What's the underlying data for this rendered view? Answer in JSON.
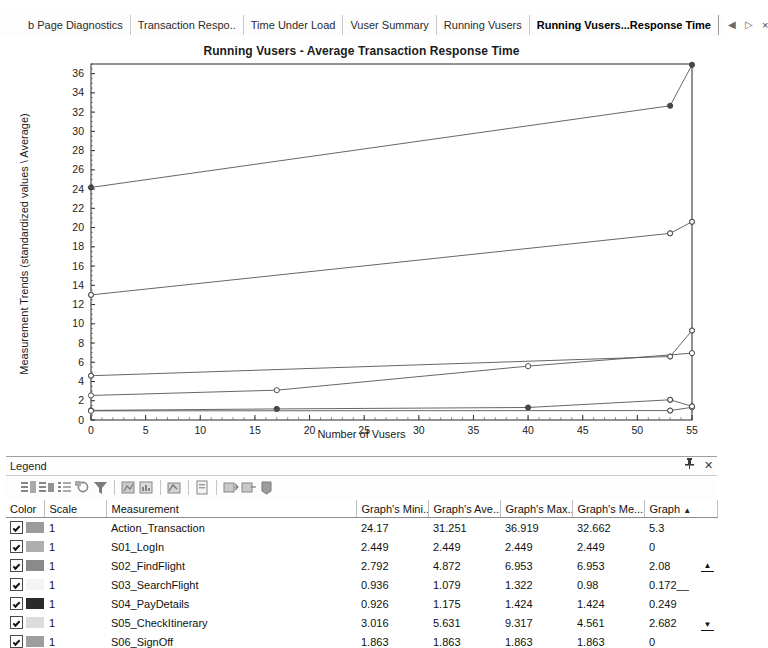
{
  "tabs": [
    {
      "label": "b Page Diagnostics",
      "active": false
    },
    {
      "label": "Transaction Respo..",
      "active": false
    },
    {
      "label": "Time Under Load",
      "active": false
    },
    {
      "label": "Vuser Summary",
      "active": false
    },
    {
      "label": "Running Vusers",
      "active": false
    },
    {
      "label": "Running Vusers...Response Time",
      "active": true
    }
  ],
  "tab_nav": {
    "prev": "◀",
    "next": "▷",
    "close": "×"
  },
  "chart_data": {
    "type": "line",
    "title": "Running Vusers - Average Transaction Response Time",
    "xlabel": "Number of Vusers",
    "ylabel": "Measurement Trends (standardized values \\ Average)",
    "xlim": [
      0,
      55
    ],
    "ylim": [
      0,
      37
    ],
    "xticks": [
      0,
      5,
      10,
      15,
      20,
      25,
      30,
      35,
      40,
      45,
      50,
      55
    ],
    "yticks": [
      0,
      2,
      4,
      6,
      8,
      10,
      12,
      14,
      16,
      18,
      20,
      22,
      24,
      26,
      28,
      30,
      32,
      34,
      36
    ],
    "grid": false,
    "legend_position": "bottom-panel",
    "series": [
      {
        "name": "Action_Transaction",
        "color": "#808080",
        "points": [
          [
            0,
            24.17
          ],
          [
            53,
            32.662
          ],
          [
            55,
            36.919
          ]
        ]
      },
      {
        "name": "S05_CheckItinerary",
        "color": "#c0c0c0",
        "points": [
          [
            0,
            13.0
          ],
          [
            53,
            19.4
          ],
          [
            55,
            20.6
          ]
        ]
      },
      {
        "name": "S02_FindFlight",
        "color": "#909090",
        "points": [
          [
            0,
            4.6
          ],
          [
            53,
            6.6
          ],
          [
            55,
            9.3
          ]
        ]
      },
      {
        "name": "S01_LogIn",
        "color": "#a8a8a8",
        "points": [
          [
            0,
            2.55
          ],
          [
            17,
            3.1
          ],
          [
            40,
            5.6
          ],
          [
            55,
            6.95
          ]
        ]
      },
      {
        "name": "S04_PayDetails",
        "color": "#303030",
        "points": [
          [
            0,
            1.0
          ],
          [
            17,
            1.15
          ],
          [
            40,
            1.3
          ],
          [
            53,
            2.1
          ],
          [
            55,
            1.42
          ]
        ]
      },
      {
        "name": "S03_SearchFlight",
        "color": "#e4e4e4",
        "points": [
          [
            0,
            0.95
          ],
          [
            53,
            0.98
          ],
          [
            55,
            1.32
          ]
        ]
      }
    ]
  },
  "legend": {
    "title": "Legend",
    "pin_icon": "pin-icon",
    "close_icon": "close-icon",
    "toolbar_icons": [
      "show-all-icon",
      "hide-all-icon",
      "list-icon",
      "configure-icon",
      "filter-icon",
      "merge-icon",
      "break-down-icon",
      "auto-correlate-icon",
      "properties-icon",
      "drill-down-icon",
      "export-icon",
      "delete-icon"
    ],
    "columns": [
      "Color",
      "Scale",
      "Measurement",
      "Graph's Mini...",
      "Graph's Ave...",
      "Graph's Max...",
      "Graph's Me...",
      "Graph"
    ],
    "sort_indicator": "▲",
    "rows": [
      {
        "checked": true,
        "color": "#9b9b9b",
        "scale": "1",
        "measurement": "Action_Transaction",
        "min": "24.17",
        "avg": "31.251",
        "max": "36.919",
        "median": "32.662",
        "last": "5.3"
      },
      {
        "checked": true,
        "color": "#aeaeae",
        "scale": "1",
        "measurement": "S01_LogIn",
        "min": "2.449",
        "avg": "2.449",
        "max": "2.449",
        "median": "2.449",
        "last": "0"
      },
      {
        "checked": true,
        "color": "#8a8a8a",
        "scale": "1",
        "measurement": "S02_FindFlight",
        "min": "2.792",
        "avg": "4.872",
        "max": "6.953",
        "median": "6.953",
        "last": "2.08"
      },
      {
        "checked": true,
        "color": "#f4f4f4",
        "scale": "1",
        "measurement": "S03_SearchFlight",
        "min": "0.936",
        "avg": "1.079",
        "max": "1.322",
        "median": "0.98",
        "last": "0.172__"
      },
      {
        "checked": true,
        "color": "#2b2b2b",
        "scale": "1",
        "measurement": "S04_PayDetails",
        "min": "0.926",
        "avg": "1.175",
        "max": "1.424",
        "median": "1.424",
        "last": "0.249"
      },
      {
        "checked": true,
        "color": "#dcdcdc",
        "scale": "1",
        "measurement": "S05_CheckItinerary",
        "min": "3.016",
        "avg": "5.631",
        "max": "9.317",
        "median": "4.561",
        "last": "2.682"
      },
      {
        "checked": true,
        "color": "#9e9e9e",
        "scale": "1",
        "measurement": "S06_SignOff",
        "min": "1.863",
        "avg": "1.863",
        "max": "1.863",
        "median": "1.863",
        "last": "0"
      }
    ]
  }
}
